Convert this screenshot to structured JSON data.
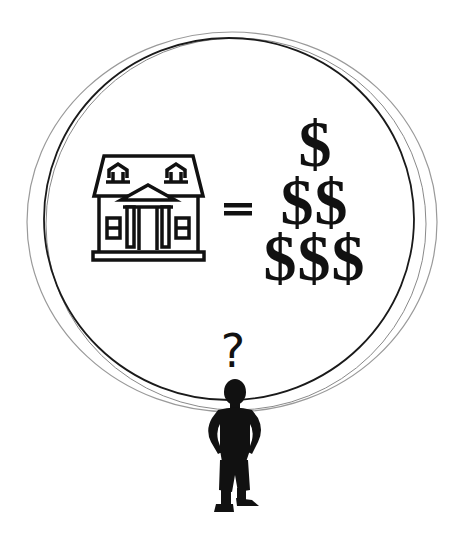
{
  "illustration": {
    "equation": {
      "left": "house-icon",
      "operator": "=",
      "right": {
        "symbol": "$",
        "rows": [
          1,
          2,
          3
        ]
      }
    },
    "question": "?",
    "figure": "person-silhouette",
    "colors": {
      "ink": "#111111",
      "ring_dark": "#1a1a1a",
      "ring_light": "#8a8a8a",
      "background": "#ffffff"
    }
  }
}
